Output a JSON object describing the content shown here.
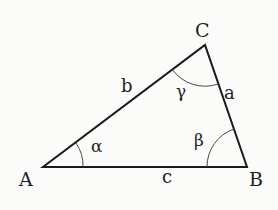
{
  "diagram": {
    "type": "triangle",
    "vertices": [
      {
        "label": "A",
        "x": 43,
        "y": 167
      },
      {
        "label": "B",
        "x": 247,
        "y": 167
      },
      {
        "label": "C",
        "x": 205,
        "y": 45
      }
    ],
    "sides": [
      {
        "label": "a",
        "between": "B-C"
      },
      {
        "label": "b",
        "between": "A-C"
      },
      {
        "label": "c",
        "between": "A-B"
      }
    ],
    "angles": [
      {
        "label": "α",
        "vertex": "A"
      },
      {
        "label": "β",
        "vertex": "B"
      },
      {
        "label": "γ",
        "vertex": "C"
      }
    ],
    "colors": {
      "stroke": "#1a1a1a",
      "arc": "#4a4a4a",
      "background": "#fbfbfa"
    }
  }
}
